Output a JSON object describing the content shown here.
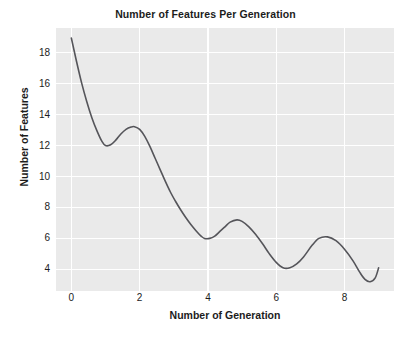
{
  "chart_data": {
    "type": "line",
    "title": "Number of Features Per Generation",
    "xlabel": "Number of Generation",
    "ylabel": "Number of Features",
    "xlim": [
      -0.45,
      9.45
    ],
    "ylim": [
      2.6,
      19.6
    ],
    "xticks": [
      0,
      2,
      4,
      6,
      8
    ],
    "yticks": [
      4,
      6,
      8,
      10,
      12,
      14,
      16,
      18
    ],
    "xtick_labels": [
      "0",
      "2",
      "4",
      "6",
      "8"
    ],
    "ytick_labels": [
      "4",
      "6",
      "8",
      "10",
      "12",
      "14",
      "16",
      "18"
    ],
    "grid": true,
    "grid_color": "#ffffff",
    "plot_background": "#eaeaea",
    "figure_background": "#ffffff",
    "legend": null,
    "series": [
      {
        "name": "Number of Features",
        "color": "#55555a",
        "line_width": 1.6,
        "x": [
          0.0,
          0.15,
          0.3,
          0.45,
          0.6,
          0.75,
          0.9,
          1.0,
          1.15,
          1.3,
          1.45,
          1.6,
          1.75,
          1.85,
          2.0,
          2.15,
          2.3,
          2.45,
          2.6,
          2.75,
          2.9,
          3.05,
          3.2,
          3.35,
          3.5,
          3.65,
          3.8,
          3.9,
          4.05,
          4.2,
          4.35,
          4.5,
          4.65,
          4.85,
          5.0,
          5.2,
          5.4,
          5.6,
          5.8,
          6.0,
          6.2,
          6.4,
          6.6,
          6.8,
          7.05,
          7.25,
          7.5,
          7.75,
          8.0,
          8.25,
          8.45,
          8.6,
          8.75,
          8.9,
          9.0
        ],
        "y": [
          18.95,
          17.45,
          16.05,
          14.85,
          13.8,
          12.95,
          12.25,
          12.0,
          12.05,
          12.35,
          12.75,
          13.05,
          13.2,
          13.22,
          13.05,
          12.6,
          11.95,
          11.2,
          10.45,
          9.7,
          9.0,
          8.4,
          7.85,
          7.35,
          6.9,
          6.5,
          6.15,
          6.0,
          6.0,
          6.15,
          6.45,
          6.75,
          7.05,
          7.2,
          7.1,
          6.75,
          6.25,
          5.65,
          5.0,
          4.45,
          4.1,
          4.1,
          4.35,
          4.8,
          5.55,
          6.0,
          6.1,
          5.85,
          5.3,
          4.55,
          3.8,
          3.35,
          3.2,
          3.45,
          4.1
        ]
      }
    ],
    "annotations": []
  }
}
